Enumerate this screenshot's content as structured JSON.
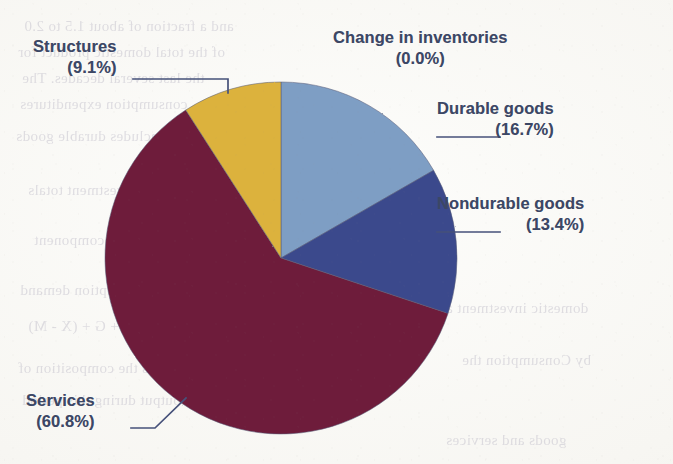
{
  "figure": {
    "background_color": "#fbfaf7",
    "text_color": "#3c4765",
    "leader_color": "#46517a"
  },
  "chart_data": {
    "type": "pie",
    "title": "",
    "legend_position": "callout-labels",
    "start_angle_deg": 0,
    "direction": "clockwise",
    "categories": [
      "Durable goods",
      "Nondurable goods",
      "Services",
      "Structures",
      "Change in inventories"
    ],
    "values": [
      16.7,
      13.4,
      60.8,
      9.1,
      0.0
    ],
    "value_unit": "percent",
    "colors": [
      "#7e9ec4",
      "#3a4a8c",
      "#6e1b3a",
      "#dcb23c",
      "#7e9ec4"
    ],
    "slices": [
      {
        "label": "Durable goods",
        "value": 16.7,
        "display": "(16.7%)",
        "color": "#7e9ec4"
      },
      {
        "label": "Nondurable goods",
        "value": 13.4,
        "display": "(13.4%)",
        "color": "#3a4a8c"
      },
      {
        "label": "Services",
        "value": 60.8,
        "display": "(60.8%)",
        "color": "#6e1b3a"
      },
      {
        "label": "Structures",
        "value": 9.1,
        "display": "(9.1%)",
        "color": "#dcb23c"
      },
      {
        "label": "Change in inventories",
        "value": 0.0,
        "display": "(0.0%)",
        "color": "#7e9ec4"
      }
    ]
  },
  "labels": {
    "inventories": {
      "name": "Change in inventories",
      "pct": "(0.0%)"
    },
    "durable": {
      "name": "Durable goods",
      "pct": "(16.7%)"
    },
    "nondurable": {
      "name": "Nondurable goods",
      "pct": "(13.4%)"
    },
    "structures": {
      "name": "Structures",
      "pct": "(9.1%)"
    },
    "services": {
      "name": "Services",
      "pct": "(60.8%)"
    }
  },
  "page_bleed": {
    "lines": [
      {
        "text": "and a fraction of about 1.5 to 2.0",
        "x": 24,
        "y": 18,
        "size": 15
      },
      {
        "text": "of the total domestic product for",
        "x": 18,
        "y": 44,
        "size": 15
      },
      {
        "text": "the last several decades. The",
        "x": 22,
        "y": 70,
        "size": 15
      },
      {
        "text": "consumption expenditures",
        "x": 20,
        "y": 96,
        "size": 15
      },
      {
        "text": "includes durable goods",
        "x": 16,
        "y": 128,
        "size": 15
      },
      {
        "text": "fixed investment totals",
        "x": 28,
        "y": 182,
        "size": 15
      },
      {
        "text": "increase in component",
        "x": 34,
        "y": 232,
        "size": 15
      },
      {
        "text": "the Consumption demand",
        "x": 20,
        "y": 282,
        "size": 15
      },
      {
        "text": "C + I + G + (X - M)",
        "x": 28,
        "y": 318,
        "size": 15
      },
      {
        "text": "Figure 2 shows the composition of",
        "x": 18,
        "y": 360,
        "size": 15
      },
      {
        "text": "national output during this period",
        "x": 22,
        "y": 392,
        "size": 15
      },
      {
        "text": "domestic investment and",
        "x": 430,
        "y": 300,
        "size": 15
      },
      {
        "text": "by Consumption the",
        "x": 462,
        "y": 352,
        "size": 15
      },
      {
        "text": "goods and services",
        "x": 446,
        "y": 432,
        "size": 15
      }
    ]
  }
}
